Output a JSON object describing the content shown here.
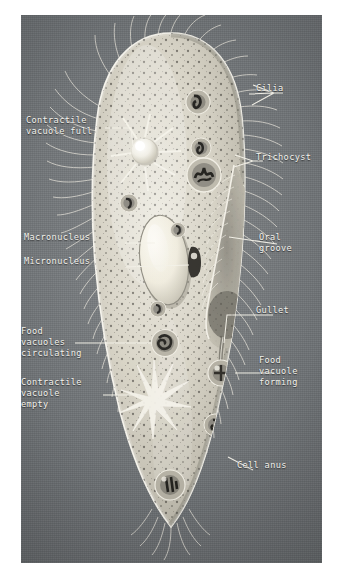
{
  "figure": {
    "plate_background": "#6f7376",
    "label_color": "#f2f1ec",
    "border_color": "#ffffff",
    "type": "labeled biological illustration"
  },
  "labels": {
    "cilia": "Cilia",
    "contractile_vacuole_full": "Contractile\nvacuole full",
    "trichocyst": "Trichocyst",
    "macronucleus": "Macronucleus",
    "micronucleus": "Micronucleus",
    "oral_groove": "Oral\ngroove",
    "gullet": "Gullet",
    "food_vacuoles_circulating": "Food\nvacuoles\ncirculating",
    "food_vacuole_forming": "Food\nvacuole\nforming",
    "contractile_vacuole_empty": "Contractile\nvacuole\nempty",
    "cell_anus": "Cell anus"
  },
  "structures": [
    {
      "name": "cell-body",
      "note": "elongated slipper-shaped cell outlined in pale cream"
    },
    {
      "name": "cilia-fringe",
      "note": "fine hair-like projections around entire cell margin"
    },
    {
      "name": "contractile-vacuole-full",
      "note": "bright round vacuole upper-left with radiating canals"
    },
    {
      "name": "contractile-vacuole-empty",
      "note": "star of radiating canals, lower-left, no central bulb"
    },
    {
      "name": "macronucleus",
      "note": "large pale oval body at cell centre"
    },
    {
      "name": "micronucleus",
      "note": "small dark body immediately right of macronucleus"
    },
    {
      "name": "oral-groove",
      "note": "funnel-shaped depression on right margin"
    },
    {
      "name": "gullet",
      "note": "narrow channel descending from oral groove"
    },
    {
      "name": "food-vacuole-forming",
      "note": "vacuole budding at base of gullet"
    },
    {
      "name": "food-vacuoles-circulating",
      "note": "dark-cored vacuoles distributed through cytoplasm"
    },
    {
      "name": "trichocysts",
      "note": "small dark ringed bodies near pellicle"
    },
    {
      "name": "cell-anus",
      "note": "pore on lower right margin"
    }
  ]
}
